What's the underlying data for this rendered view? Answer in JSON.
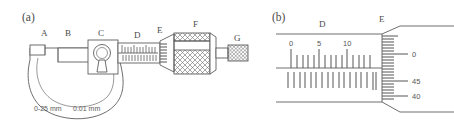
{
  "figure": {
    "type": "micrometer-screw-gauge-diagram",
    "background_color": "#ffffff",
    "line_color": "#5d5d5d",
    "text_color": "#4a4a4a"
  },
  "panel_a": {
    "panel_label": "(a)",
    "caption": "Micrometer screw gauge with labelled parts",
    "part_labels": [
      {
        "key": "A",
        "label": "A",
        "part": "anvil",
        "x": 44,
        "y": 35
      },
      {
        "key": "B",
        "label": "B",
        "part": "spindle",
        "x": 68,
        "y": 35
      },
      {
        "key": "C",
        "label": "C",
        "part": "lock-nut",
        "x": 100,
        "y": 35
      },
      {
        "key": "D",
        "label": "D",
        "part": "sleeve-main-scale",
        "x": 137,
        "y": 36
      },
      {
        "key": "E",
        "label": "E",
        "part": "thimble-edge-vernier",
        "x": 160,
        "y": 32
      },
      {
        "key": "F",
        "label": "F",
        "part": "thimble",
        "x": 196,
        "y": 26
      },
      {
        "key": "G",
        "label": "G",
        "part": "ratchet-stop",
        "x": 237,
        "y": 40
      }
    ],
    "frame_text": {
      "range": "0-25 mm",
      "least_count": "0.01 mm",
      "combined": "0-25 mm   0.01 mm"
    }
  },
  "panel_b": {
    "panel_label": "(b)",
    "caption": "Magnified view of the sleeve and thimble scales",
    "part_labels": [
      {
        "key": "D",
        "label": "D",
        "part": "sleeve-main-scale",
        "x": 322,
        "y": 26
      },
      {
        "key": "E",
        "label": "E",
        "part": "thimble-scale",
        "x": 382,
        "y": 22
      }
    ],
    "sleeve_scale": {
      "name": "main-scale",
      "unit": "mm",
      "numbers": [
        {
          "label": "0",
          "value": 0,
          "x": 292
        },
        {
          "label": "5",
          "value": 5,
          "x": 319
        },
        {
          "label": "10",
          "value": 10,
          "x": 347
        }
      ],
      "upper_tick_count": 14,
      "lower_tick_count": 14,
      "tick_spacing_px": 5.6
    },
    "thimble_scale": {
      "name": "circular-scale",
      "unit": "0.01 mm divisions",
      "numbers": [
        {
          "label": "0",
          "value": 0,
          "y": 57
        },
        {
          "label": "45",
          "value": 45,
          "y": 84
        },
        {
          "label": "40",
          "value": 40,
          "y": 101
        }
      ],
      "tick_count": 22
    }
  }
}
